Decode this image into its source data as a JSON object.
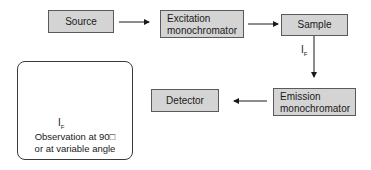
{
  "diagram": {
    "nodes": {
      "source": "Source",
      "excitation_line1": "Excitation",
      "excitation_line2": "monochromator",
      "sample": "Sample",
      "emission_line1": "Emission",
      "emission_line2": "monochromator",
      "detector": "Detector"
    },
    "edge_label": {
      "main": "I",
      "sub": "F"
    },
    "inset": {
      "caption_line1": "Observation at 90□",
      "caption_line2": "or at variable angle",
      "label_main": "I",
      "label_sub": "F"
    },
    "colors": {
      "box_fill": "#d4d4d4",
      "box_border": "#5a5a5a",
      "arrow": "#1a1a1a"
    }
  }
}
